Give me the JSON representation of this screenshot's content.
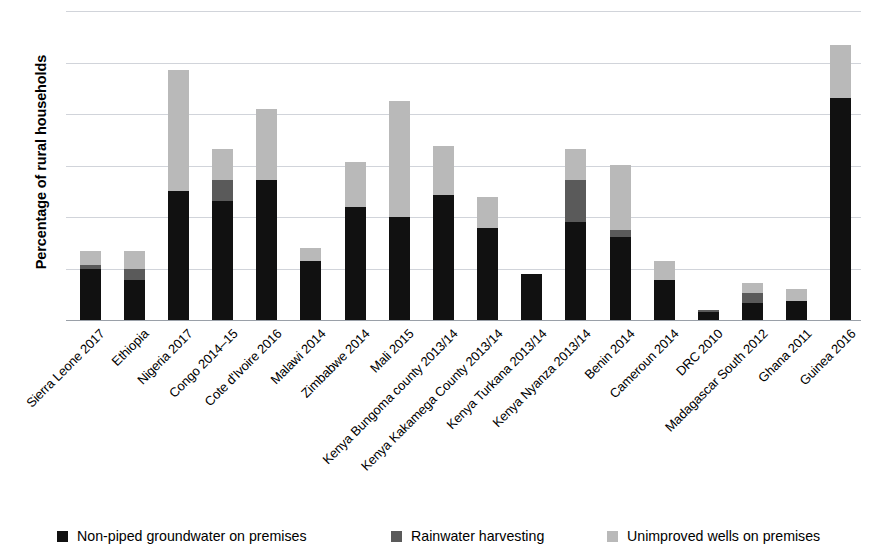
{
  "chart_data": {
    "type": "bar",
    "stacked": true,
    "title": "",
    "xlabel": "",
    "ylabel": "Percentage of rural households",
    "ylim": [
      0,
      30
    ],
    "yticks": [
      0,
      5,
      10,
      15,
      20,
      25,
      30
    ],
    "ytick_labels": [
      "0",
      "5",
      "10",
      "15",
      "20",
      "25",
      "30"
    ],
    "grid": true,
    "legend_position": "bottom",
    "categories": [
      "Sierra Leone 2017",
      "Ethiopia",
      "Nigeria 2017",
      "Congo 2014–15",
      "Cote d'Ivoire 2016",
      "Malawi 2014",
      "Zimbabwe 2014",
      "Mali 2015",
      "Kenya Bungoma county 2013/14",
      "Kenya Kakamega County 2013/14",
      "Kenya Turkana 2013/14",
      "Kenya Nyanza 2013/14",
      "Benin 2014",
      "Cameroun 2014",
      "DRC 2010",
      "Madagascar South 2012",
      "Ghana 2011",
      "Guinea 2016"
    ],
    "series": [
      {
        "name": "Non-piped groundwater on premises",
        "color": "#111111",
        "values": [
          5.0,
          3.9,
          12.5,
          11.6,
          13.6,
          5.7,
          11.0,
          10.0,
          12.1,
          8.9,
          4.5,
          9.5,
          8.1,
          3.9,
          0.8,
          1.7,
          1.8,
          21.6
        ]
      },
      {
        "name": "Rainwater harvesting",
        "color": "#5a5a5a",
        "values": [
          0.3,
          1.1,
          0.0,
          2.0,
          0.0,
          0.0,
          0.0,
          0.0,
          0.0,
          0.0,
          0.0,
          4.1,
          0.6,
          0.0,
          0.2,
          0.9,
          0.0,
          0.0
        ]
      },
      {
        "name": "Unimproved wells on premises",
        "color": "#b9b9b9",
        "values": [
          1.4,
          1.7,
          11.8,
          3.0,
          6.9,
          1.3,
          4.3,
          11.3,
          4.8,
          3.0,
          0.0,
          3.0,
          6.4,
          1.8,
          0.0,
          1.0,
          1.2,
          5.1
        ]
      }
    ],
    "totals": [
      6.7,
      6.7,
      24.3,
      16.6,
      20.5,
      7.0,
      15.3,
      21.3,
      16.9,
      11.9,
      4.5,
      16.6,
      15.1,
      5.7,
      1.0,
      3.6,
      3.0,
      26.7
    ]
  },
  "legend": {
    "items": [
      {
        "label": "Non-piped groundwater on premises",
        "color": "#111111"
      },
      {
        "label": "Rainwater harvesting",
        "color": "#5a5a5a"
      },
      {
        "label": "Unimproved wells on premises",
        "color": "#b9b9b9"
      }
    ]
  }
}
